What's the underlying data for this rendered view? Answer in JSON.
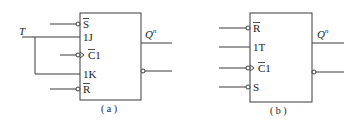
{
  "diagram": {
    "type": "flip-flop logic symbols",
    "colors": {
      "line": "#3a3a3a",
      "text": "#222222",
      "background": "#ffffff"
    },
    "a": {
      "caption": "( a )",
      "external_input": "T",
      "inputs": [
        {
          "label": "S",
          "overbar": true,
          "bubble": true
        },
        {
          "label": "1J",
          "overbar": false,
          "bubble": false
        },
        {
          "label": "C1",
          "overbar": true,
          "bubble": true,
          "clock_edge": true
        },
        {
          "label": "1K",
          "overbar": false,
          "bubble": false
        },
        {
          "label": "R",
          "overbar": true,
          "bubble": true
        }
      ],
      "outputs": [
        {
          "label": "Q",
          "superscript": "n",
          "bubble": false
        },
        {
          "label": "",
          "bubble": true
        }
      ],
      "note": "T connected to both 1J and 1K"
    },
    "b": {
      "caption": "( b )",
      "inputs": [
        {
          "label": "R",
          "overbar": true,
          "bubble": true
        },
        {
          "label": "1T",
          "overbar": false,
          "bubble": false
        },
        {
          "label": "C1",
          "overbar": true,
          "bubble": true,
          "clock_edge": true
        },
        {
          "label": "S",
          "overbar": false,
          "bubble": true
        }
      ],
      "outputs": [
        {
          "label": "Q",
          "superscript": "n",
          "bubble": false
        },
        {
          "label": "",
          "bubble": true
        }
      ]
    }
  }
}
